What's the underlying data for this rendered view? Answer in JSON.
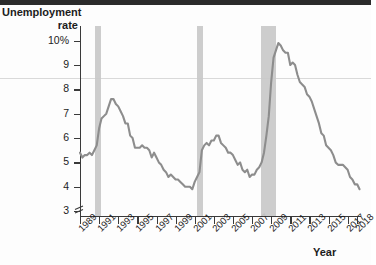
{
  "chart_data": {
    "type": "line",
    "title": "",
    "xlabel": "Year",
    "ylabel": "Unemployment rate",
    "ylim": [
      2.8,
      10.6
    ],
    "xlim": [
      1989,
      2018.4
    ],
    "grid": false,
    "legend": "none",
    "axis_break": true,
    "line_color": "#8d8d8d",
    "band_color": "#c9c9c9",
    "ytick_labels": [
      "10%",
      "9",
      "8",
      "7",
      "6",
      "5",
      "4",
      "3"
    ],
    "ytick_values": [
      10,
      9,
      8,
      7,
      6,
      5,
      4,
      3
    ],
    "xtick_labels": [
      "1989",
      "1991",
      "1993",
      "1995",
      "1997",
      "1999",
      "2001",
      "2003",
      "2005",
      "2007",
      "2009",
      "2011",
      "2013",
      "2015",
      "2017",
      "2018"
    ],
    "xtick_values": [
      1989,
      1991,
      1993,
      1995,
      1997,
      1999,
      2001,
      2003,
      2005,
      2007,
      2009,
      2011,
      2013,
      2015,
      2017,
      2018
    ],
    "recession_bands": [
      {
        "label": "1990-1991 recession",
        "start": 1990.58,
        "end": 1991.25
      },
      {
        "label": "2001 recession",
        "start": 2001.25,
        "end": 2001.92
      },
      {
        "label": "2007-2009 recession",
        "start": 2007.92,
        "end": 2009.5
      }
    ],
    "x": [
      1989.0,
      1989.25,
      1989.5,
      1989.75,
      1990.0,
      1990.25,
      1990.5,
      1990.75,
      1991.0,
      1991.25,
      1991.5,
      1991.75,
      1992.0,
      1992.25,
      1992.5,
      1992.75,
      1993.0,
      1993.25,
      1993.5,
      1993.75,
      1994.0,
      1994.25,
      1994.5,
      1994.75,
      1995.0,
      1995.25,
      1995.5,
      1995.75,
      1996.0,
      1996.25,
      1996.5,
      1996.75,
      1997.0,
      1997.25,
      1997.5,
      1997.75,
      1998.0,
      1998.25,
      1998.5,
      1998.75,
      1999.0,
      1999.25,
      1999.5,
      1999.75,
      2000.0,
      2000.25,
      2000.5,
      2000.75,
      2001.0,
      2001.25,
      2001.5,
      2001.75,
      2002.0,
      2002.25,
      2002.5,
      2002.75,
      2003.0,
      2003.25,
      2003.5,
      2003.75,
      2004.0,
      2004.25,
      2004.5,
      2004.75,
      2005.0,
      2005.25,
      2005.5,
      2005.75,
      2006.0,
      2006.25,
      2006.5,
      2006.75,
      2007.0,
      2007.25,
      2007.5,
      2007.75,
      2008.0,
      2008.25,
      2008.5,
      2008.75,
      2009.0,
      2009.25,
      2009.5,
      2009.75,
      2010.0,
      2010.25,
      2010.5,
      2010.75,
      2011.0,
      2011.25,
      2011.5,
      2011.75,
      2012.0,
      2012.25,
      2012.5,
      2012.75,
      2013.0,
      2013.25,
      2013.5,
      2013.75,
      2014.0,
      2014.25,
      2014.5,
      2014.75,
      2015.0,
      2015.25,
      2015.5,
      2015.75,
      2016.0,
      2016.25,
      2016.5,
      2016.75,
      2017.0,
      2017.25,
      2017.5,
      2017.75,
      2018.0,
      2018.25
    ],
    "y": [
      5.4,
      5.2,
      5.3,
      5.3,
      5.4,
      5.3,
      5.5,
      5.7,
      6.4,
      6.8,
      6.9,
      7.0,
      7.3,
      7.6,
      7.6,
      7.4,
      7.3,
      7.1,
      6.9,
      6.6,
      6.6,
      6.1,
      6.0,
      5.6,
      5.6,
      5.6,
      5.7,
      5.6,
      5.6,
      5.5,
      5.2,
      5.4,
      5.2,
      5.0,
      4.9,
      4.7,
      4.6,
      4.4,
      4.5,
      4.4,
      4.3,
      4.3,
      4.2,
      4.1,
      4.0,
      4.0,
      4.0,
      3.9,
      4.2,
      4.4,
      4.6,
      5.5,
      5.7,
      5.8,
      5.7,
      5.9,
      5.9,
      6.1,
      6.1,
      5.8,
      5.7,
      5.6,
      5.4,
      5.4,
      5.3,
      5.1,
      4.9,
      5.0,
      4.7,
      4.6,
      4.7,
      4.4,
      4.5,
      4.5,
      4.7,
      4.8,
      5.0,
      5.4,
      6.1,
      6.9,
      8.3,
      9.3,
      9.6,
      9.9,
      9.8,
      9.6,
      9.5,
      9.5,
      9.0,
      9.1,
      9.0,
      8.6,
      8.3,
      8.2,
      8.1,
      7.8,
      7.7,
      7.5,
      7.2,
      6.9,
      6.6,
      6.2,
      6.1,
      5.7,
      5.6,
      5.5,
      5.3,
      5.0,
      4.9,
      4.9,
      4.9,
      4.8,
      4.7,
      4.4,
      4.3,
      4.1,
      4.1,
      3.9
    ],
    "annotations": []
  },
  "labels": {
    "y_axis_title_line1": "Unemployment",
    "y_axis_title_line2": "rate",
    "x_axis_title": "Year"
  }
}
